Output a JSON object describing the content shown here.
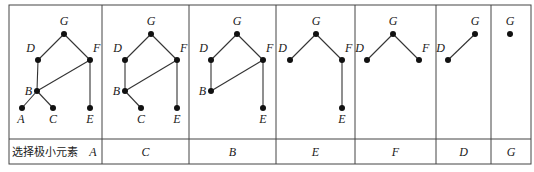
{
  "table": {
    "row_label": "选择极小元素",
    "columns": [
      {
        "selected": "A",
        "nodes": {
          "G": [
            64,
            34
          ],
          "D": [
            38,
            60
          ],
          "F": [
            90,
            60
          ],
          "B": [
            37,
            91
          ],
          "A": [
            22,
            108
          ],
          "C": [
            53,
            108
          ],
          "E": [
            90,
            108
          ]
        },
        "edges": [
          [
            "G",
            "D"
          ],
          [
            "G",
            "F"
          ],
          [
            "D",
            "B"
          ],
          [
            "F",
            "B"
          ],
          [
            "F",
            "E"
          ],
          [
            "B",
            "A"
          ],
          [
            "B",
            "C"
          ]
        ]
      },
      {
        "selected": "C",
        "nodes": {
          "G": [
            151,
            34
          ],
          "D": [
            125,
            60
          ],
          "F": [
            177,
            60
          ],
          "B": [
            125,
            91
          ],
          "C": [
            141,
            108
          ],
          "E": [
            177,
            108
          ]
        },
        "edges": [
          [
            "G",
            "D"
          ],
          [
            "G",
            "F"
          ],
          [
            "D",
            "B"
          ],
          [
            "F",
            "B"
          ],
          [
            "F",
            "E"
          ],
          [
            "B",
            "C"
          ]
        ]
      },
      {
        "selected": "B",
        "nodes": {
          "G": [
            237,
            34
          ],
          "D": [
            211,
            60
          ],
          "F": [
            263,
            60
          ],
          "B": [
            211,
            91
          ],
          "E": [
            263,
            108
          ]
        },
        "edges": [
          [
            "G",
            "D"
          ],
          [
            "G",
            "F"
          ],
          [
            "D",
            "B"
          ],
          [
            "F",
            "B"
          ],
          [
            "F",
            "E"
          ]
        ]
      },
      {
        "selected": "E",
        "nodes": {
          "G": [
            316,
            34
          ],
          "D": [
            290,
            60
          ],
          "F": [
            342,
            60
          ],
          "E": [
            342,
            108
          ]
        },
        "edges": [
          [
            "G",
            "D"
          ],
          [
            "G",
            "F"
          ],
          [
            "F",
            "E"
          ]
        ]
      },
      {
        "selected": "F",
        "nodes": {
          "G": [
            393,
            34
          ],
          "D": [
            367,
            60
          ],
          "F": [
            419,
            60
          ]
        },
        "edges": [
          [
            "G",
            "D"
          ],
          [
            "G",
            "F"
          ]
        ]
      },
      {
        "selected": "D",
        "nodes": {
          "G": [
            475,
            34
          ],
          "D": [
            448,
            60
          ]
        },
        "edges": [
          [
            "G",
            "D"
          ]
        ]
      },
      {
        "selected": "G",
        "nodes": {
          "G": [
            510,
            34
          ]
        },
        "edges": []
      }
    ]
  },
  "label_offsets": {
    "G": [
      0,
      -9,
      "middle"
    ],
    "D": [
      -3,
      -8,
      "end"
    ],
    "F": [
      3,
      -8,
      "start"
    ],
    "B": [
      -5,
      4,
      "end"
    ],
    "A": [
      -1,
      15,
      "middle"
    ],
    "C": [
      0,
      15,
      "middle"
    ],
    "E": [
      0,
      15,
      "middle"
    ]
  },
  "grid": {
    "left": 9,
    "right": 531,
    "top": 5,
    "mid": 139,
    "bottom": 164,
    "dividers": [
      102,
      189,
      276,
      355,
      436,
      491
    ]
  },
  "colors": {
    "line": "#333333",
    "node": "#111111",
    "border": "#444444"
  }
}
